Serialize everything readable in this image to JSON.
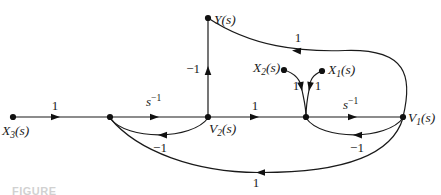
{
  "figure": {
    "caption_fragment": "FIGURE",
    "colors": {
      "ink": "#1a1a1a",
      "background": "#ffffff"
    }
  },
  "diagram": {
    "type": "signal-flow-graph",
    "nodes": {
      "x3": {
        "base": "X",
        "sub": "3",
        "arg": "(s)"
      },
      "y": {
        "base": "Y",
        "sub": "",
        "arg": "(s)"
      },
      "v2": {
        "base": "V",
        "sub": "2",
        "arg": "(s)"
      },
      "v1": {
        "base": "V",
        "sub": "1",
        "arg": "(s)"
      },
      "x2": {
        "base": "X",
        "sub": "2",
        "arg": "(s)"
      },
      "x1": {
        "base": "X",
        "sub": "1",
        "arg": "(s)"
      }
    },
    "branches": [
      {
        "from": "X3(s)",
        "to": "node-1",
        "gain": "1"
      },
      {
        "from": "node-1",
        "to": "V2(s)",
        "gain_base": "s",
        "gain_exp": "−1"
      },
      {
        "from": "V2(s)",
        "to": "node-2",
        "gain": "1"
      },
      {
        "from": "node-2",
        "to": "V1(s)",
        "gain_base": "s",
        "gain_exp": "−1"
      },
      {
        "from": "V2(s)",
        "to": "Y(s)",
        "gain": "−1"
      },
      {
        "from": "V1(s)",
        "to": "Y(s)",
        "gain": "1"
      },
      {
        "from": "X2(s)",
        "to": "node-2",
        "gain": "1"
      },
      {
        "from": "X1(s)",
        "to": "node-2",
        "gain": "1"
      },
      {
        "from": "V2(s)",
        "to": "node-1",
        "gain": "−1"
      },
      {
        "from": "V1(s)",
        "to": "node-2",
        "gain": "−1"
      },
      {
        "from": "V1(s)",
        "to": "node-1",
        "gain": "1"
      }
    ]
  }
}
